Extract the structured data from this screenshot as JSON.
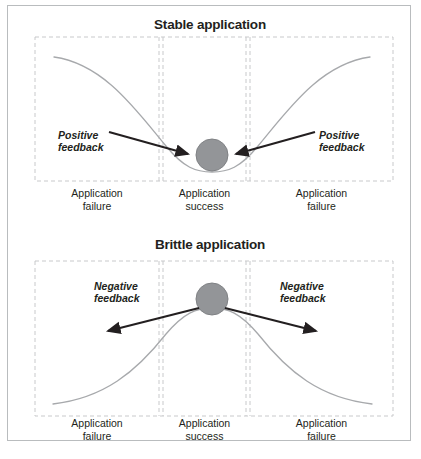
{
  "figure": {
    "width": 421,
    "height": 459,
    "background": "#ffffff",
    "border_color": "#b9bcbe"
  },
  "style": {
    "curve_color": "#a7a9ac",
    "dash_color": "#c8c9cb",
    "ball_fill": "#939598",
    "ball_stroke": "#808285",
    "arrow_color": "#231f20",
    "text_color": "#231f20"
  },
  "panels": [
    {
      "id": "stable",
      "title": "Stable application",
      "curve_shape": "valley",
      "ball": {
        "cx": 204,
        "cy": 149,
        "r": 16
      },
      "feedback": {
        "label": "Positive\nfeedback",
        "left": {
          "text": "Positive\nfeedback",
          "arrow_from": [
            105,
            128
          ],
          "arrow_to": [
            182,
            148
          ]
        },
        "right": {
          "text": "Positive\nfeedback",
          "arrow_from": [
            300,
            128
          ],
          "arrow_to": [
            226,
            148
          ]
        }
      },
      "zones": [
        {
          "id": "left-failure",
          "label": "Application\nfailure"
        },
        {
          "id": "center-success",
          "label": "Application\nsuccess"
        },
        {
          "id": "right-failure",
          "label": "Application\nfailure"
        }
      ]
    },
    {
      "id": "brittle",
      "title": "Brittle application",
      "curve_shape": "hill",
      "ball": {
        "cx": 204,
        "cy": 67,
        "r": 16
      },
      "feedback": {
        "label": "Negative\nfeedback",
        "left": {
          "text": "Negative\nfeedback",
          "arrow_from": [
            190,
            76
          ],
          "arrow_to": [
            98,
            100
          ]
        },
        "right": {
          "text": "Negative\nfeedback",
          "arrow_from": [
            218,
            76
          ],
          "arrow_to": [
            310,
            100
          ]
        }
      },
      "zones": [
        {
          "id": "left-failure",
          "label": "Application\nfailure"
        },
        {
          "id": "center-success",
          "label": "Application\nsuccess"
        },
        {
          "id": "right-failure",
          "label": "Application\nfailure"
        }
      ]
    }
  ]
}
